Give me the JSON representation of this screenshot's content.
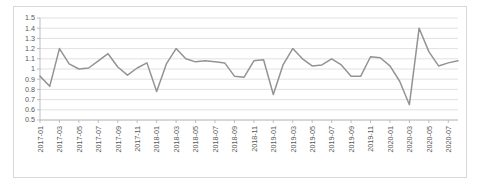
{
  "chart_data": {
    "type": "line",
    "title": "",
    "subtitle": "",
    "xlabel": "",
    "ylabel": "",
    "ylim": [
      0.5,
      1.5
    ],
    "ytick_step": 0.1,
    "ytick_labels": [
      "1.5",
      "1.4",
      "1.3",
      "1.2",
      "1.1",
      "1",
      "0.9",
      "0.8",
      "0.7",
      "0.6",
      "0.5"
    ],
    "ytick_values": [
      1.5,
      1.4,
      1.3,
      1.2,
      1.1,
      1.0,
      0.9,
      0.8,
      0.7,
      0.6,
      0.5
    ],
    "grid": true,
    "grid_axis": "y",
    "legend": false,
    "legend_position": "none",
    "line_color": "#939393",
    "grid_color": "#d9d9d9",
    "axis_color": "#b7b7b7",
    "border_color": "#d9d9d9",
    "background_color": "#ffffff",
    "xtick_label_rotation": -90,
    "xtick_every_n": 2,
    "xtick_labels": [
      "2017-01",
      "2017-03",
      "2017-05",
      "2017-07",
      "2017-09",
      "2017-11",
      "2018-01",
      "2018-03",
      "2018-05",
      "2018-07",
      "2018-09",
      "2018-11",
      "2019-01",
      "2019-03",
      "2019-05",
      "2019-07",
      "2019-09",
      "2019-11",
      "2020-01",
      "2020-03",
      "2020-05",
      "2020-07"
    ],
    "x": [
      "2017-01",
      "2017-02",
      "2017-03",
      "2017-04",
      "2017-05",
      "2017-06",
      "2017-07",
      "2017-08",
      "2017-09",
      "2017-10",
      "2017-11",
      "2017-12",
      "2018-01",
      "2018-02",
      "2018-03",
      "2018-04",
      "2018-05",
      "2018-06",
      "2018-07",
      "2018-08",
      "2018-09",
      "2018-10",
      "2018-11",
      "2018-12",
      "2019-01",
      "2019-02",
      "2019-03",
      "2019-04",
      "2019-05",
      "2019-06",
      "2019-07",
      "2019-08",
      "2019-09",
      "2019-10",
      "2019-11",
      "2019-12",
      "2020-01",
      "2020-02",
      "2020-03",
      "2020-04",
      "2020-05",
      "2020-06",
      "2020-07",
      "2020-08"
    ],
    "values": [
      0.93,
      0.83,
      1.2,
      1.05,
      1.0,
      1.01,
      1.08,
      1.15,
      1.02,
      0.94,
      1.01,
      1.06,
      0.78,
      1.05,
      1.2,
      1.1,
      1.07,
      1.08,
      1.07,
      1.06,
      0.93,
      0.92,
      1.08,
      1.09,
      0.75,
      1.04,
      1.2,
      1.1,
      1.03,
      1.04,
      1.1,
      1.04,
      0.93,
      0.93,
      1.12,
      1.11,
      1.03,
      0.88,
      0.65,
      1.4,
      1.17,
      1.03,
      1.06,
      1.08
    ],
    "series": [
      {
        "name": "value",
        "color": "#939393",
        "values": [
          0.93,
          0.83,
          1.2,
          1.05,
          1.0,
          1.01,
          1.08,
          1.15,
          1.02,
          0.94,
          1.01,
          1.06,
          0.78,
          1.05,
          1.2,
          1.1,
          1.07,
          1.08,
          1.07,
          1.06,
          0.93,
          0.92,
          1.08,
          1.09,
          0.75,
          1.04,
          1.2,
          1.1,
          1.03,
          1.04,
          1.1,
          1.04,
          0.93,
          0.93,
          1.12,
          1.11,
          1.03,
          0.88,
          0.65,
          1.4,
          1.17,
          1.03,
          1.06,
          1.08
        ]
      }
    ]
  }
}
